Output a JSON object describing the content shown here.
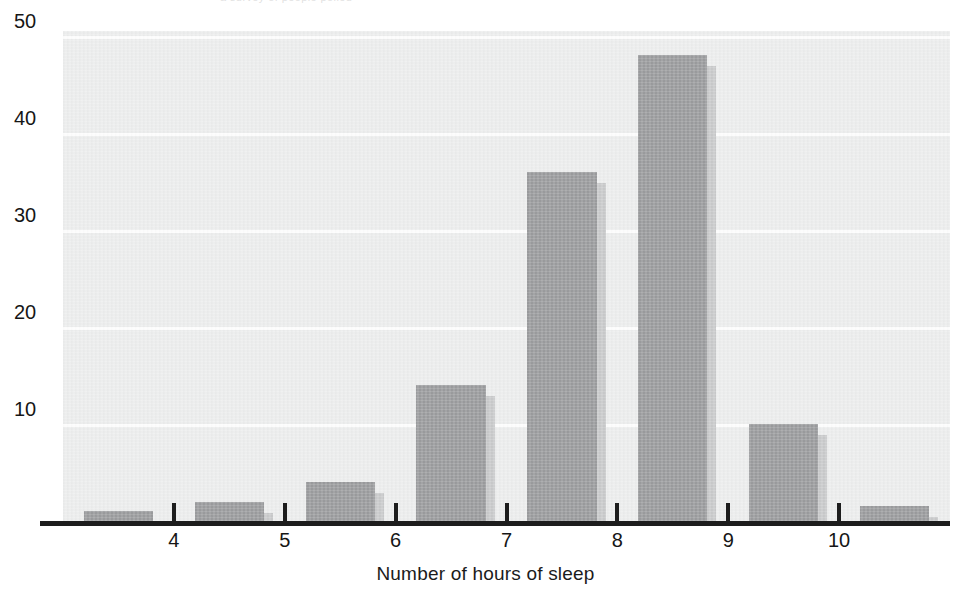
{
  "figure": {
    "top_caption_remnant": "a survey of people polled",
    "background_color": "#ffffff",
    "panel_color": "#eceded",
    "gridline_color": "#fdfdfd",
    "axis_color": "#1d1d1d"
  },
  "chart_data": {
    "type": "bar",
    "title": "",
    "xlabel": "Number of hours of sleep",
    "ylabel": "Percent of people polled",
    "categories": [
      "3-4",
      "4-5",
      "5-6",
      "6-7",
      "7-8",
      "8-9",
      "9-10",
      "10-11"
    ],
    "values": [
      1,
      2,
      4,
      14,
      36,
      48,
      10,
      1.5
    ],
    "bin_centers": [
      3.5,
      4.5,
      5.5,
      6.5,
      7.5,
      8.5,
      9.5,
      10.5
    ],
    "x_ticks": [
      4,
      5,
      6,
      7,
      8,
      9,
      10
    ],
    "x_tick_labels": [
      "4",
      "5",
      "6",
      "7",
      "8",
      "9",
      "10"
    ],
    "y_ticks": [
      10,
      20,
      30,
      40,
      50
    ],
    "y_tick_labels": [
      "10",
      "20",
      "30",
      "40",
      "50"
    ],
    "ylim": [
      0,
      50.5
    ],
    "xlim": [
      3.0,
      11.0
    ],
    "grid": true,
    "grid_axis": "y",
    "legend": false,
    "legend_position": "none",
    "bar_color": "#9b9c9e",
    "bar_shadow_color": "#c9cacb",
    "bar_has_drop_shadow": true
  }
}
